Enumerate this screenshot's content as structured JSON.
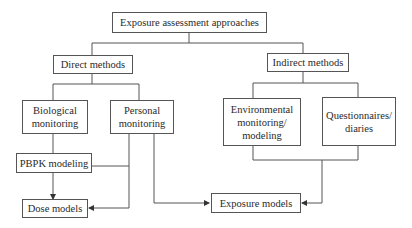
{
  "diagram": {
    "title": "Exposure assessment approaches",
    "nodes": {
      "root": "Exposure assessment approaches",
      "direct": "Direct methods",
      "indirect": "Indirect methods",
      "biological": "Biological\nmonitoring",
      "personal": "Personal\nmonitoring",
      "environmental": "Environmental\nmonitoring/\nmodeling",
      "questionnaires": "Questionnaires/\ndiaries",
      "pbpk": "PBPK modeling",
      "dose": "Dose models",
      "exposure": "Exposure models"
    },
    "edges": [
      {
        "from": "root",
        "to": "direct"
      },
      {
        "from": "root",
        "to": "indirect"
      },
      {
        "from": "direct",
        "to": "biological"
      },
      {
        "from": "direct",
        "to": "personal"
      },
      {
        "from": "indirect",
        "to": "environmental"
      },
      {
        "from": "indirect",
        "to": "questionnaires"
      },
      {
        "from": "biological",
        "to": "pbpk"
      },
      {
        "from": "pbpk",
        "to": "dose",
        "arrow": true
      },
      {
        "from": "personal",
        "to": "dose",
        "arrow": true
      },
      {
        "from": "personal",
        "to": "exposure",
        "arrow": true
      },
      {
        "from": "environmental",
        "to": "exposure",
        "arrow": true
      },
      {
        "from": "questionnaires",
        "to": "exposure",
        "arrow": true
      }
    ],
    "colors": {
      "line": "#555555",
      "text": "#2a2a2a",
      "background": "#ffffff"
    }
  }
}
